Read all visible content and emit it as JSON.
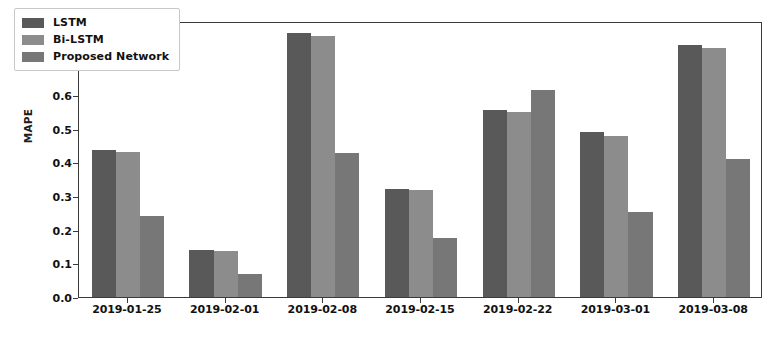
{
  "chart_data": {
    "type": "bar",
    "title": "",
    "xlabel": "",
    "ylabel": "MAPE",
    "categories": [
      "2019-01-25",
      "2019-02-01",
      "2019-02-08",
      "2019-02-15",
      "2019-02-22",
      "2019-03-01",
      "2019-03-08"
    ],
    "series": [
      {
        "name": "LSTM",
        "color": "#595959",
        "values": [
          0.437,
          0.139,
          0.785,
          0.321,
          0.555,
          0.491,
          0.75
        ]
      },
      {
        "name": "Bi-LSTM",
        "color": "#8c8c8c",
        "values": [
          0.43,
          0.137,
          0.775,
          0.318,
          0.549,
          0.479,
          0.741
        ]
      },
      {
        "name": "Proposed Network",
        "color": "#777777",
        "values": [
          0.24,
          0.069,
          0.427,
          0.175,
          0.615,
          0.253,
          0.41
        ]
      }
    ],
    "ylim": [
      0.0,
      0.82
    ],
    "yticks": [
      0.0,
      0.1,
      0.2,
      0.3,
      0.4,
      0.5,
      0.6,
      0.7,
      0.8
    ],
    "ytick_labels": [
      "0.0",
      "0.1",
      "0.2",
      "0.3",
      "0.4",
      "0.5",
      "0.6",
      "0.7",
      "0.8"
    ],
    "grid": false,
    "legend_position": "upper left",
    "frame": true
  },
  "legend": {
    "entries": [
      {
        "label": "LSTM"
      },
      {
        "label": "Bi-LSTM"
      },
      {
        "label": "Proposed Network"
      }
    ]
  },
  "axes": {
    "y_label": "MAPE"
  }
}
